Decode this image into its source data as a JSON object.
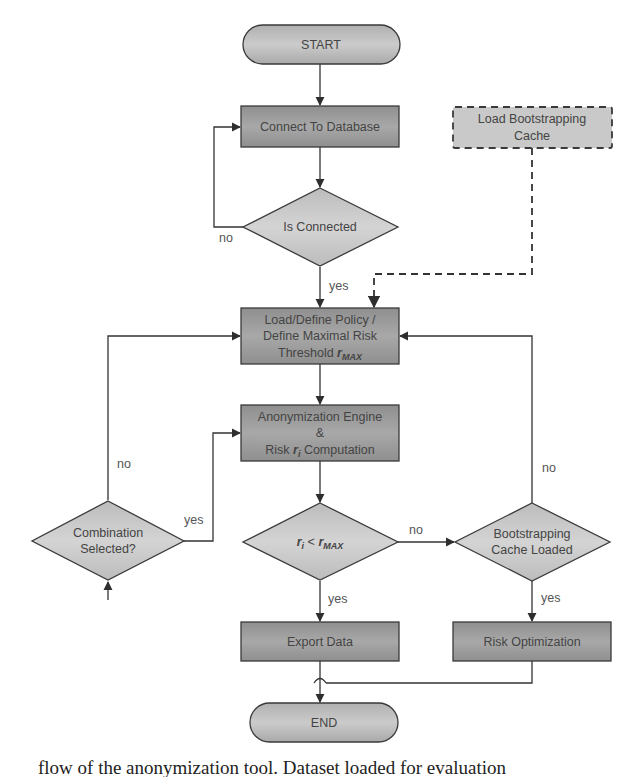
{
  "diagram": {
    "colors": {
      "process_fill": "#9a9a9a",
      "decision_fill": "#c6c6c6",
      "terminal_fill": "#bdbdbd",
      "stroke": "#3a3a3a",
      "text": "#444444"
    },
    "nodes": {
      "start": {
        "type": "terminal",
        "label": "START"
      },
      "connect": {
        "type": "process",
        "label": "Connect To Database"
      },
      "is_connected": {
        "type": "decision",
        "label": "Is Connected"
      },
      "load_cache": {
        "type": "process-dashed",
        "line1": "Load Bootstrapping",
        "line2": "Cache"
      },
      "load_policy": {
        "type": "process",
        "line1": "Load/Define Policy /",
        "line2": "Define Maximal Risk",
        "line3_prefix": "Threshold ",
        "line3_var": "r",
        "line3_sub": "MAX"
      },
      "anon_engine": {
        "type": "process",
        "line1": "Anonymization Engine",
        "line2": "&",
        "line3_prefix": "Risk ",
        "line3_var": "r",
        "line3_sub": "i",
        "line3_suffix": " Computation"
      },
      "risk_check": {
        "type": "decision",
        "var1": "r",
        "sub1": "i",
        "op": " < ",
        "var2": "r",
        "sub2": "MAX"
      },
      "combination": {
        "type": "decision",
        "line1": "Combination",
        "line2": "Selected?"
      },
      "cache_loaded": {
        "type": "decision",
        "line1": "Bootstrapping",
        "line2": "Cache Loaded"
      },
      "export": {
        "type": "process",
        "label": "Export Data"
      },
      "risk_opt": {
        "type": "process",
        "label": "Risk Optimization"
      },
      "end": {
        "type": "terminal",
        "label": "END"
      }
    },
    "edge_labels": {
      "is_connected_no": "no",
      "is_connected_yes": "yes",
      "combination_no": "no",
      "combination_yes": "yes",
      "risk_check_no": "no",
      "risk_check_yes": "yes",
      "cache_loaded_no": "no",
      "cache_loaded_yes": "yes"
    }
  },
  "caption": {
    "text": "flow of the anonymization tool. Dataset loaded for evaluation"
  }
}
